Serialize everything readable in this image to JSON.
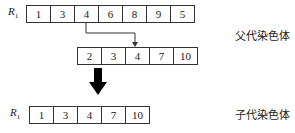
{
  "parent_row": {
    "label": "R",
    "sub": "1",
    "values": [
      "1",
      "3",
      "4",
      "6",
      "8",
      "9",
      "5"
    ]
  },
  "donor_row": {
    "values": [
      "2",
      "3",
      "4",
      "7",
      "10"
    ]
  },
  "child_row": {
    "label": "R",
    "sub": "1",
    "values": [
      "1",
      "3",
      "4",
      "7",
      "10"
    ]
  },
  "captions": {
    "parent": "父代染色体",
    "child": "子代染色体"
  }
}
